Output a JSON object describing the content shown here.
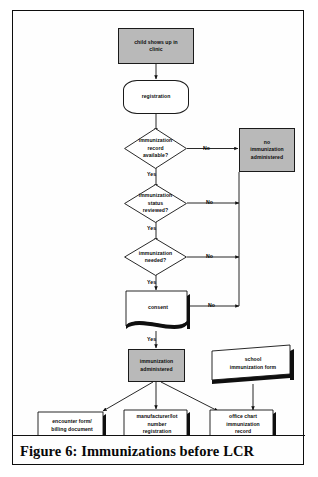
{
  "figure": {
    "caption": "Figure 6:  Immunizations before LCR"
  },
  "diagram": {
    "type": "flowchart",
    "title": "Immunizations before LCR",
    "nodes": [
      {
        "id": "start",
        "label": "child shows up in clinic",
        "shape": "process-gray"
      },
      {
        "id": "registration",
        "label": "registration",
        "shape": "terminal"
      },
      {
        "id": "record",
        "label": "immunization record available?",
        "shape": "decision"
      },
      {
        "id": "status",
        "label": "immunization status reviewed?",
        "shape": "decision"
      },
      {
        "id": "needed",
        "label": "immunization needed?",
        "shape": "decision"
      },
      {
        "id": "consent",
        "label": "consent",
        "shape": "document"
      },
      {
        "id": "noimmun",
        "label": "no immunization administered",
        "shape": "process-gray"
      },
      {
        "id": "administered",
        "label": "immunization administered",
        "shape": "process-gray"
      },
      {
        "id": "schoolform",
        "label": "school immunization form",
        "shape": "slant-shadow"
      },
      {
        "id": "encounter",
        "label": "encounter form/ billing document",
        "shape": "document"
      },
      {
        "id": "manufacturer",
        "label": "manufacturer/lot number registration",
        "shape": "document"
      },
      {
        "id": "officechart",
        "label": "office chart immunization record",
        "shape": "document"
      }
    ],
    "node_text": {
      "start_line1": "child shows up in",
      "start_line2": "clinic",
      "registration": "registration",
      "record_line1": "immunization",
      "record_line2": "record",
      "record_line3": "available?",
      "status_line1": "immunization",
      "status_line2": "status",
      "status_line3": "reviewed?",
      "needed_line1": "immunization",
      "needed_line2": "needed?",
      "consent": "consent",
      "noimmun_line1": "no",
      "noimmun_line2": "immunization",
      "noimmun_line3": "administered",
      "administered_line1": "immunization",
      "administered_line2": "administered",
      "schoolform_line1": "school",
      "schoolform_line2": "immunization form",
      "encounter_line1": "encounter form/",
      "encounter_line2": "billing document",
      "manufacturer_line1": "manufacturer/lot",
      "manufacturer_line2": "number",
      "manufacturer_line3": "registration",
      "officechart_line1": "office chart",
      "officechart_line2": "immunization",
      "officechart_line3": "record"
    },
    "edge_labels": {
      "record_no": "No",
      "record_yes": "Yes",
      "status_no": "No",
      "status_yes": "Yes",
      "needed_no": "No",
      "needed_yes": "Yes",
      "consent_no": "No",
      "consent_yes": "Yes"
    },
    "colors": {
      "process_fill": "#b9b9b9",
      "stroke": "#1a1a1a",
      "paper": "#ffffff",
      "text": "#0a0a0a"
    }
  }
}
